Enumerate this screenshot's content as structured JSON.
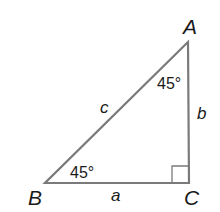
{
  "diagram": {
    "type": "right-triangle",
    "vertices": {
      "A": {
        "label": "A"
      },
      "B": {
        "label": "B"
      },
      "C": {
        "label": "C"
      }
    },
    "sides": {
      "a": {
        "label": "a"
      },
      "b": {
        "label": "b"
      },
      "c": {
        "label": "c"
      }
    },
    "angles": {
      "A": {
        "label": "45°"
      },
      "B": {
        "label": "45°"
      },
      "C": {
        "label": "right-angle"
      }
    },
    "colors": {
      "stroke": "#7a7a7a",
      "text": "#1a1a1a",
      "background": "#ffffff"
    }
  }
}
